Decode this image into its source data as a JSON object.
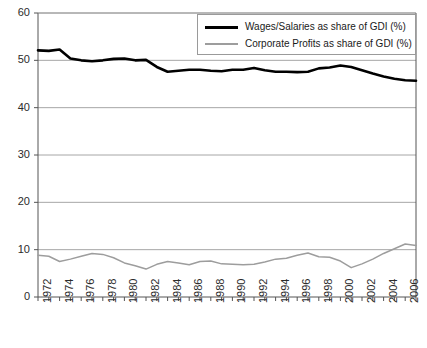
{
  "chart_data": {
    "type": "line",
    "title": "",
    "subtitle": "",
    "xlabel": "",
    "ylabel": "",
    "xlim": [
      1972,
      2007
    ],
    "ylim": [
      0,
      60
    ],
    "yticks": [
      0,
      10,
      20,
      30,
      40,
      50,
      60
    ],
    "grid": "horizontal",
    "legend_position": "top-right",
    "x": [
      1972,
      1973,
      1974,
      1975,
      1976,
      1977,
      1978,
      1979,
      1980,
      1981,
      1982,
      1983,
      1984,
      1985,
      1986,
      1987,
      1988,
      1989,
      1990,
      1991,
      1992,
      1993,
      1994,
      1995,
      1996,
      1997,
      1998,
      1999,
      2000,
      2001,
      2002,
      2003,
      2004,
      2005,
      2006,
      2007
    ],
    "xticks_labeled": [
      1972,
      1974,
      1976,
      1978,
      1980,
      1982,
      1984,
      1986,
      1988,
      1990,
      1992,
      1994,
      1996,
      1998,
      2000,
      2002,
      2004,
      2006
    ],
    "series": [
      {
        "name": "Wages/Salaries as share of GDI (%)",
        "color": "#000000",
        "values": [
          52.1,
          52.0,
          52.3,
          50.4,
          50.0,
          49.8,
          50.0,
          50.3,
          50.4,
          50.0,
          50.1,
          48.6,
          47.6,
          47.8,
          48.0,
          48.0,
          47.8,
          47.7,
          48.0,
          48.0,
          48.4,
          47.9,
          47.6,
          47.6,
          47.5,
          47.6,
          48.3,
          48.5,
          48.9,
          48.6,
          47.9,
          47.2,
          46.6,
          46.1,
          45.8,
          45.7
        ]
      },
      {
        "name": "Corporate Profits as share of GDI (%)",
        "color": "#9d9d9d",
        "values": [
          8.8,
          8.6,
          7.5,
          8.0,
          8.6,
          9.2,
          9.0,
          8.3,
          7.2,
          6.6,
          5.9,
          6.9,
          7.5,
          7.2,
          6.8,
          7.5,
          7.6,
          7.0,
          6.9,
          6.8,
          6.9,
          7.4,
          8.0,
          8.2,
          8.8,
          9.3,
          8.5,
          8.4,
          7.6,
          6.2,
          7.0,
          8.0,
          9.2,
          10.2,
          11.2,
          10.9
        ]
      }
    ],
    "legend": [
      {
        "label": "Wages/Salaries as share of GDI (%)",
        "color": "#000000",
        "width": 3
      },
      {
        "label": "Corporate Profits as share of GDI (%)",
        "color": "#9d9d9d",
        "width": 2
      }
    ]
  },
  "geometry": {
    "plot_left": 38,
    "plot_right": 416,
    "plot_top": 13,
    "plot_bottom": 297
  }
}
